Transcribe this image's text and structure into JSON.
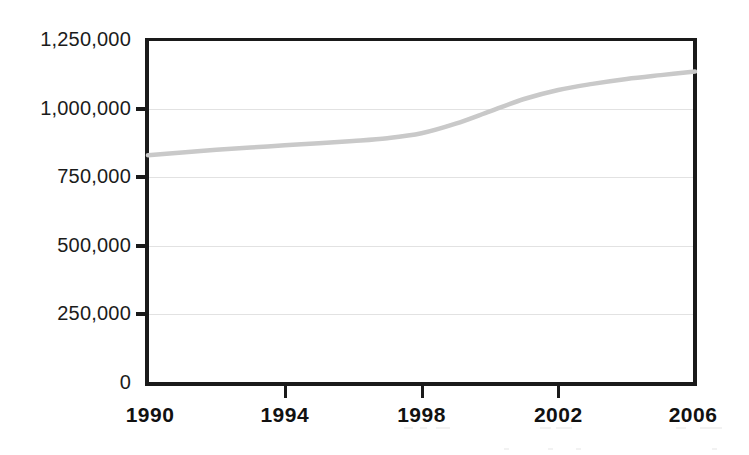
{
  "chart_data": {
    "type": "line",
    "title": "",
    "subtitle": "",
    "xlabel": "",
    "ylabel": "",
    "xlim": [
      1990,
      2006
    ],
    "ylim": [
      0,
      1250000
    ],
    "grid": true,
    "legend": "none",
    "line_color": "#c9c9c9",
    "axis_color": "#1a1a1a",
    "gridline_color": "#e2e2e2",
    "y_ticks": [
      0,
      250000,
      500000,
      750000,
      1000000,
      1250000
    ],
    "y_tick_labels": [
      "0",
      "250,000",
      "500,000",
      "750,000",
      "1,000,000",
      "1,250,000"
    ],
    "x_ticks": [
      1990,
      1994,
      1998,
      2002,
      2006
    ],
    "x_tick_labels": [
      "1990",
      "1994",
      "1998",
      "2002",
      "2006"
    ],
    "x": [
      1990,
      1991,
      1992,
      1993,
      1994,
      1995,
      1996,
      1997,
      1998,
      1999,
      2000,
      2001,
      2002,
      2003,
      2004,
      2005,
      2006
    ],
    "series": [
      {
        "name": "Series 1",
        "color": "#c9c9c9",
        "values": [
          830000,
          840000,
          850000,
          858000,
          866000,
          874000,
          882000,
          892000,
          910000,
          945000,
          990000,
          1035000,
          1068000,
          1090000,
          1108000,
          1122000,
          1135000
        ]
      }
    ]
  },
  "axis_labels": {
    "y": [
      {
        "value": 1250000,
        "text": "1,250,000"
      },
      {
        "value": 1000000,
        "text": "1,000,000"
      },
      {
        "value": 750000,
        "text": "750,000"
      },
      {
        "value": 500000,
        "text": "500,000"
      },
      {
        "value": 250000,
        "text": "250,000"
      },
      {
        "value": 0,
        "text": "0"
      }
    ],
    "x": [
      {
        "value": 1990,
        "text": "1990"
      },
      {
        "value": 1994,
        "text": "1994"
      },
      {
        "value": 1998,
        "text": "1998"
      },
      {
        "value": 2002,
        "text": "2002"
      },
      {
        "value": 2006,
        "text": "2006"
      }
    ]
  }
}
